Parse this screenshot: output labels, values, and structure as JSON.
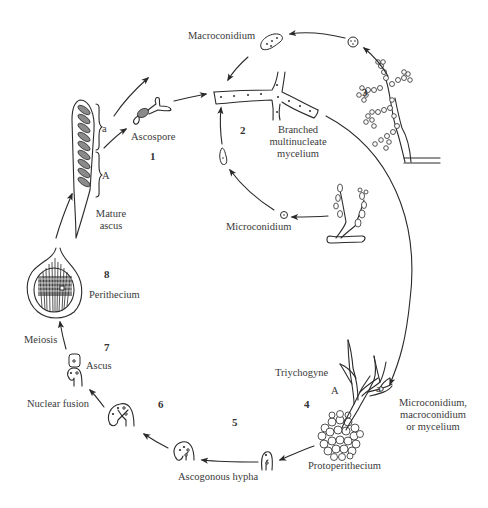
{
  "diagram": {
    "title": "",
    "type": "life-cycle",
    "stages": [
      {
        "number": "1",
        "label": "Ascospore"
      },
      {
        "number": "2",
        "label": "Branched multinucleate mycelium",
        "lines": [
          "Branched",
          "multinucleate",
          "mycelium"
        ]
      },
      {
        "number": "3",
        "label": "Conidiophore (macroconidia)"
      },
      {
        "number": "4",
        "label": "Protoperithecium with trichogyne"
      },
      {
        "number": "5",
        "label": "Ascogonous hypha"
      },
      {
        "number": "6",
        "label": "Nuclear fusion"
      },
      {
        "number": "7",
        "label": "Ascus"
      },
      {
        "number": "8",
        "label": "Perithecium"
      }
    ],
    "labels": {
      "macroconidium": "Macroconidium",
      "microconidium": "Microconidium",
      "ascospore": "Ascospore",
      "mycelium_l1": "Branched",
      "mycelium_l2": "multinucleate",
      "mycelium_l3": "mycelium",
      "mature_ascus_l1": "Mature",
      "mature_ascus_l2": "ascus",
      "mating_a": "a",
      "mating_A": "A",
      "perithecium": "Perithecium",
      "meiosis": "Meiosis",
      "ascus": "Ascus",
      "nuclear_fusion": "Nuclear fusion",
      "ascogonous_hypha": "Ascogonous hypha",
      "protoperithecium": "Protoperithecium",
      "trichogyne": "Triychogyne",
      "fertilizer_l1": "Microconidium,",
      "fertilizer_l2": "macroconidium",
      "fertilizer_l3": "or mycelium",
      "trich_A": "A",
      "trich_a": "a"
    },
    "numbers": {
      "n1": "1",
      "n2": "2",
      "n3": "3",
      "n4": "4",
      "n5": "5",
      "n6": "6",
      "n7": "7",
      "n8": "8"
    },
    "colors": {
      "ink": "#2a2a2a",
      "spore_fill": "#8a8a8a",
      "text": "#3a3a3a",
      "background": "#ffffff"
    }
  }
}
